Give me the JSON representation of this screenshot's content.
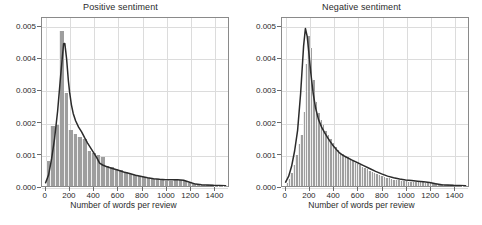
{
  "figure": {
    "width": 482,
    "height": 225,
    "background": "#ffffff",
    "bar_color": "#9e9e9e",
    "curve_color": "#2b2b2b",
    "grid_color": "#dcdcdc",
    "axis_color": "#8a8a8a"
  },
  "panels": [
    {
      "id": "positive",
      "title": "Positive sentiment",
      "xlabel": "Number of words per review",
      "ylabel": "",
      "xticks": [
        0,
        200,
        400,
        600,
        800,
        1000,
        1200,
        1400
      ],
      "xtick_labels": [
        "0",
        "200",
        "400",
        "600",
        "800",
        "1000",
        "1200",
        "1400"
      ],
      "yticks": [
        0,
        0.001,
        0.002,
        0.003,
        0.004,
        0.005
      ],
      "ytick_labels": [
        "0.000",
        "0.001",
        "0.002",
        "0.003",
        "0.004",
        "0.005"
      ],
      "xlim": [
        -30,
        1520
      ],
      "ylim": [
        0,
        0.00528
      ]
    },
    {
      "id": "negative",
      "title": "Negative sentiment",
      "xlabel": "Number of words per review",
      "ylabel": "",
      "xticks": [
        0,
        200,
        400,
        600,
        800,
        1000,
        1200,
        1400
      ],
      "xtick_labels": [
        "0",
        "200",
        "400",
        "600",
        "800",
        "1000",
        "1200",
        "1400"
      ],
      "yticks": [
        0,
        0.001,
        0.002,
        0.003,
        0.004,
        0.005
      ],
      "ytick_labels": [
        "0.000",
        "0.001",
        "0.002",
        "0.003",
        "0.004",
        "0.005"
      ],
      "xlim": [
        -30,
        1520
      ],
      "ylim": [
        0,
        0.00528
      ]
    }
  ],
  "chart_data": [
    {
      "type": "bar",
      "id": "positive-sentiment-histogram",
      "title": "Positive sentiment",
      "xlabel": "Number of words per review",
      "ylabel": "",
      "xlim": [
        -30,
        1520
      ],
      "ylim": [
        0,
        0.00528
      ],
      "grid": true,
      "legend": "none",
      "bin_width": 37.5,
      "bin_left_edges": [
        0,
        37.5,
        75,
        112.5,
        150,
        187.5,
        225,
        262.5,
        300,
        337.5,
        375,
        412.5,
        450,
        487.5,
        525,
        562.5,
        600,
        637.5,
        675,
        712.5,
        750,
        787.5,
        825,
        862.5,
        900,
        937.5,
        975,
        1012.5,
        1050,
        1087.5,
        1125,
        1162.5,
        1200,
        1237.5,
        1275,
        1312.5,
        1350,
        1387.5,
        1425,
        1462.5
      ],
      "densities": [
        0.00077,
        0.00185,
        0.00188,
        0.00483,
        0.0029,
        0.00175,
        0.0016,
        0.00152,
        0.00147,
        0.0011,
        0.00101,
        0.00096,
        0.0009,
        0.00061,
        0.00058,
        0.00054,
        0.0005,
        0.00042,
        0.00038,
        0.00034,
        0.00031,
        0.00028,
        0.00026,
        0.00023,
        0.00021,
        0.00019,
        0.00017,
        0.00016,
        0.0002,
        0.00019,
        0.00017,
        9e-05,
        5e-05,
        4e-05,
        3e-05,
        2e-05,
        2e-05,
        1e-05,
        1e-05,
        1e-05
      ],
      "kde_x": [
        0,
        25,
        50,
        75,
        100,
        125,
        150,
        160,
        175,
        190,
        200,
        215,
        230,
        250,
        275,
        300,
        325,
        350,
        375,
        400,
        425,
        450,
        475,
        500,
        550,
        600,
        650,
        700,
        750,
        800,
        850,
        900,
        950,
        1000,
        1050,
        1100,
        1150,
        1200,
        1250,
        1300,
        1400,
        1500
      ],
      "kde_y": [
        0.0001,
        0.00035,
        0.00085,
        0.0015,
        0.00235,
        0.00345,
        0.00447,
        0.00448,
        0.004,
        0.0033,
        0.00295,
        0.00255,
        0.00228,
        0.00205,
        0.00185,
        0.0017,
        0.00152,
        0.00135,
        0.0012,
        0.00105,
        0.0009,
        0.00072,
        0.00066,
        0.00062,
        0.00056,
        0.0005,
        0.00044,
        0.00039,
        0.00034,
        0.0003,
        0.00026,
        0.00023,
        0.00021,
        0.0002,
        0.0002,
        0.0002,
        0.00018,
        0.00012,
        6e-05,
        4e-05,
        2e-05,
        1e-05
      ]
    },
    {
      "type": "bar",
      "id": "negative-sentiment-histogram",
      "title": "Negative sentiment",
      "xlabel": "Number of words per review",
      "ylabel": "",
      "xlim": [
        -30,
        1520
      ],
      "ylim": [
        0,
        0.00528
      ],
      "grid": true,
      "legend": "none",
      "bin_width": 20,
      "bin_left_edges": [
        0,
        20,
        40,
        60,
        80,
        100,
        120,
        140,
        160,
        180,
        200,
        220,
        240,
        260,
        280,
        300,
        320,
        340,
        360,
        380,
        400,
        420,
        440,
        460,
        480,
        500,
        520,
        540,
        560,
        580,
        600,
        620,
        640,
        660,
        680,
        700,
        720,
        740,
        760,
        780,
        800,
        820,
        840,
        860,
        880,
        900,
        920,
        940,
        960,
        980,
        1000,
        1020,
        1040,
        1060,
        1080,
        1100,
        1120,
        1140,
        1160,
        1180,
        1200,
        1250,
        1300,
        1350,
        1400,
        1450
      ],
      "densities": [
        0.0001,
        0.00022,
        0.0004,
        0.00065,
        0.00095,
        0.0013,
        0.00158,
        0.0023,
        0.0038,
        0.00465,
        0.0043,
        0.0033,
        0.00262,
        0.00228,
        0.00205,
        0.00188,
        0.00172,
        0.00158,
        0.00145,
        0.00133,
        0.00122,
        0.00112,
        0.00104,
        0.00098,
        0.00094,
        0.0009,
        0.00084,
        0.00078,
        0.00073,
        0.00069,
        0.00064,
        0.0006,
        0.00056,
        0.00052,
        0.00048,
        0.00044,
        0.0004,
        0.00037,
        0.00034,
        0.00031,
        0.00028,
        0.00026,
        0.00024,
        0.00022,
        0.0002,
        0.00019,
        0.00018,
        0.00017,
        0.00016,
        0.00015,
        0.00014,
        0.00013,
        0.00013,
        0.00012,
        0.00012,
        0.00011,
        0.00011,
        0.0001,
        0.0001,
        9e-05,
        9e-05,
        6e-05,
        4e-05,
        3e-05,
        2e-05,
        1e-05
      ],
      "kde_x": [
        0,
        25,
        50,
        75,
        100,
        125,
        150,
        165,
        180,
        195,
        210,
        230,
        250,
        275,
        300,
        325,
        350,
        375,
        400,
        425,
        450,
        475,
        500,
        550,
        600,
        650,
        700,
        750,
        800,
        850,
        900,
        950,
        1000,
        1050,
        1100,
        1150,
        1200,
        1250,
        1300,
        1400,
        1500
      ],
      "kde_y": [
        0.00012,
        0.0003,
        0.00062,
        0.0011,
        0.00175,
        0.0029,
        0.0044,
        0.00495,
        0.0047,
        0.00415,
        0.00355,
        0.0029,
        0.00245,
        0.00208,
        0.00185,
        0.00168,
        0.00152,
        0.00138,
        0.00125,
        0.00114,
        0.00104,
        0.00097,
        0.00092,
        0.00082,
        0.00073,
        0.00064,
        0.00055,
        0.00046,
        0.00038,
        0.00031,
        0.00026,
        0.00022,
        0.00019,
        0.00017,
        0.00015,
        0.00013,
        0.00011,
        7e-05,
        4e-05,
        2e-05,
        1e-05
      ]
    }
  ]
}
